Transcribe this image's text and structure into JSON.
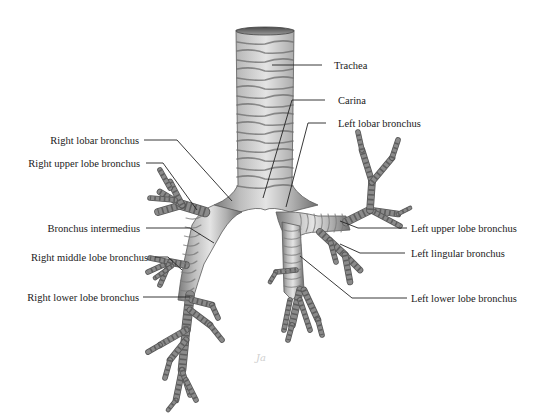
{
  "figure": {
    "signature": "Ja"
  },
  "labels": {
    "trachea": "Trachea",
    "carina": "Carina",
    "left_lobar_bronchus": "Left lobar bronchus",
    "right_lobar_bronchus": "Right lobar bronchus",
    "right_upper_lobe_bronchus": "Right upper lobe bronchus",
    "bronchus_intermedius": "Bronchus intermedius",
    "right_middle_lobe_bronchus": "Right middle lobe bronchus",
    "right_lower_lobe_bronchus": "Right lower lobe bronchus",
    "left_upper_lobe_bronchus": "Left upper lobe bronchus",
    "left_lingular_bronchus": "Left lingular bronchus",
    "left_lower_lobe_bronchus": "Left lower lobe bronchus"
  },
  "colors": {
    "background": "#ffffff",
    "tissue_light": "#d9d9d9",
    "tissue_dark": "#6a6a6a",
    "text": "#1a1a1a",
    "leader": "#222222"
  }
}
